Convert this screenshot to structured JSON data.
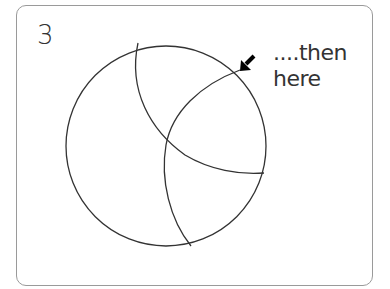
{
  "panel": {
    "step_number": "3",
    "caption_line1": "....then",
    "caption_line2": "here"
  },
  "diagram": {
    "arrow_icon": "arrow-down-left-icon",
    "stroke_color": "#333333"
  }
}
